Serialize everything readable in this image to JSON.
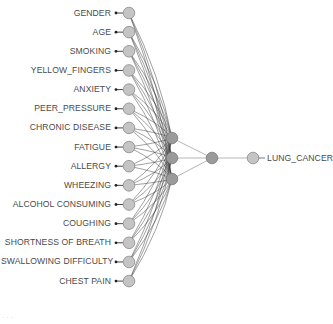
{
  "diagram": {
    "type": "neural-network",
    "inputs": [
      {
        "label": "GENDER"
      },
      {
        "label": "AGE"
      },
      {
        "label": "SMOKING"
      },
      {
        "label": "YELLOW_FINGERS"
      },
      {
        "label": "ANXIETY"
      },
      {
        "label": "PEER_PRESSURE"
      },
      {
        "label": "CHRONIC DISEASE"
      },
      {
        "label": "FATIGUE"
      },
      {
        "label": "ALLERGY"
      },
      {
        "label": "WHEEZING"
      },
      {
        "label": "ALCOHOL CONSUMING"
      },
      {
        "label": "COUGHING"
      },
      {
        "label": "SHORTNESS OF BREATH"
      },
      {
        "label": "SWALLOWING DIFFICULTY"
      },
      {
        "label": "CHEST PAIN"
      }
    ],
    "hidden_layers": [
      3,
      1
    ],
    "output": {
      "label": "LUNG_CANCER"
    },
    "colors": {
      "input_node": "#c4c4c4",
      "hidden_node": "#9a9a9a",
      "output_node": "#c4c4c4",
      "node_stroke": "#8a8a8a",
      "edge_dark": "#333333",
      "edge_light": "#b5b5b5",
      "label": "#4a4a4a"
    }
  },
  "caption": {
    "text": "· · ·"
  }
}
